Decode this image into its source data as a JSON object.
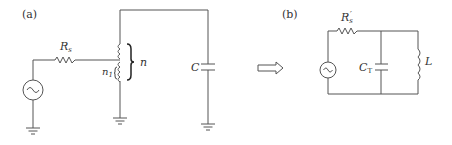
{
  "panels": {
    "a": {
      "label": "(a)",
      "components": {
        "source": "ac-source",
        "resistor_label": "R",
        "resistor_sub": "s",
        "tap_label": "n",
        "tap_sub": "1",
        "coil_label": "n",
        "capacitor_label": "C"
      }
    },
    "b": {
      "label": "(b)",
      "components": {
        "source": "ac-source",
        "resistor_label": "R",
        "resistor_sub": "s",
        "resistor_prime": "′",
        "capacitor_label": "C",
        "capacitor_sub": "T",
        "inductor_label": "L"
      }
    }
  },
  "arrow": "equivalent-transform-arrow",
  "colors": {
    "wire": "#555555",
    "text": "#333333"
  }
}
